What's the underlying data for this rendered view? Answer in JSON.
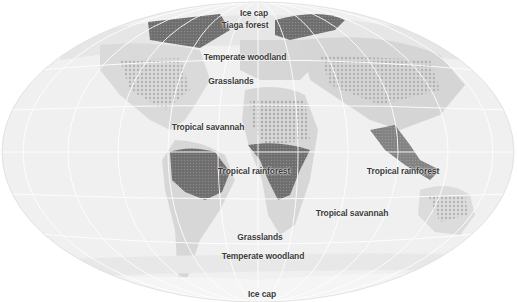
{
  "map": {
    "title": "World biomes",
    "colors": {
      "ocean": "#f1f1f1",
      "land": "#dcdcdc",
      "forest_dark": "#7a7a7a",
      "forest_mid": "#a8a8a8",
      "grid": "#ffffff",
      "label": "#3a3a3a"
    },
    "labels": [
      {
        "id": "ice-cap-north",
        "text": "Ice cap"
      },
      {
        "id": "taiga-forest",
        "text": "Tiaga forest"
      },
      {
        "id": "temperate-woodland-north",
        "text": "Temperate woodland"
      },
      {
        "id": "grasslands-north",
        "text": "Grasslands"
      },
      {
        "id": "tropical-savannah-north",
        "text": "Tropical savannah"
      },
      {
        "id": "tropical-rainforest-africa",
        "text": "Tropical rainforest"
      },
      {
        "id": "tropical-rainforest-asia",
        "text": "Tropical rainforest"
      },
      {
        "id": "tropical-savannah-south",
        "text": "Tropical savannah"
      },
      {
        "id": "grasslands-south",
        "text": "Grasslands"
      },
      {
        "id": "temperate-woodland-south",
        "text": "Temperate woodland"
      },
      {
        "id": "ice-cap-south",
        "text": "Ice cap"
      }
    ]
  }
}
